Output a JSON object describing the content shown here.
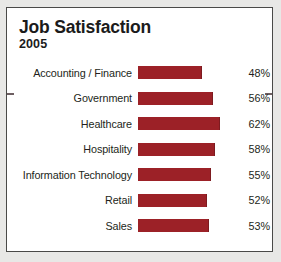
{
  "card": {
    "title": "Job Satisfaction",
    "subtitle": "2005"
  },
  "colors": {
    "bar": "#9c2127",
    "text": "#231f20",
    "border": "#4a4a48",
    "card_background": "#ffffff",
    "page_background": "#e8e8e6"
  },
  "chart_data": {
    "type": "bar",
    "orientation": "horizontal",
    "title": "Job Satisfaction",
    "subtitle": "2005",
    "xlabel": "",
    "ylabel": "",
    "xlim": [
      0,
      70
    ],
    "grid": false,
    "legend": false,
    "value_suffix": "%",
    "categories": [
      "Accounting / Finance",
      "Government",
      "Healthcare",
      "Hospitality",
      "Information Technology",
      "Retail",
      "Sales"
    ],
    "values": [
      48,
      56,
      62,
      58,
      55,
      52,
      53
    ],
    "value_labels": [
      "48%",
      "56%",
      "62%",
      "58%",
      "55%",
      "52%",
      "53%"
    ]
  }
}
